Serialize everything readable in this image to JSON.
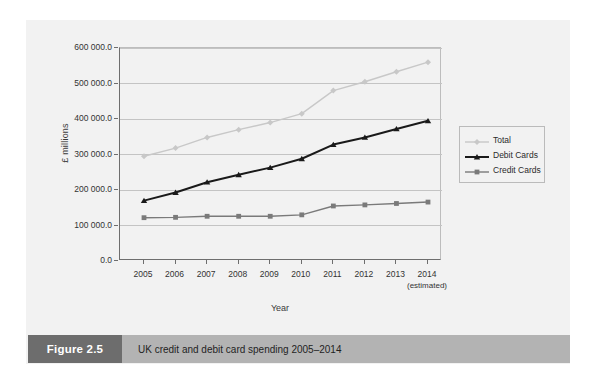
{
  "figure": {
    "caption_tag": "Figure 2.5",
    "caption_text": "UK credit and debit card spending 2005–2014"
  },
  "axes": {
    "ylabel": "£ millions",
    "xlabel": "Year",
    "estimated_note": "(estimated)"
  },
  "colors": {
    "total": "#c8c8c8",
    "debit": "#1a1a1a",
    "credit": "#7a7a7a",
    "grid": "#c4c4c4",
    "axis": "#6e6e6e",
    "page": "#f2f2f2",
    "caption_tag_bg": "#6d6d6d",
    "caption_text_bg": "#b3b3b3"
  },
  "chart_data": {
    "type": "line",
    "title": "UK credit and debit card spending 2005–2014",
    "xlabel": "Year",
    "ylabel": "£ millions",
    "grid": true,
    "legend_position": "right",
    "ylim": [
      0,
      600000
    ],
    "yticks": [
      0,
      100000,
      200000,
      300000,
      400000,
      500000,
      600000
    ],
    "ytick_labels": [
      "0.0",
      "100 000.0",
      "200 000.0",
      "300 000.0",
      "400 000.0",
      "500 000.0",
      "600 000.0"
    ],
    "categories": [
      "2005",
      "2006",
      "2007",
      "2008",
      "2009",
      "2010",
      "2011",
      "2012",
      "2013",
      "2014"
    ],
    "annotations": [
      "2014 (estimated)"
    ],
    "series": [
      {
        "name": "Total",
        "marker": "diamond",
        "color": "#c8c8c8",
        "values": [
          295000,
          318000,
          348000,
          370000,
          390000,
          415000,
          480000,
          505000,
          533000,
          560000
        ]
      },
      {
        "name": "Debit Cards",
        "marker": "triangle",
        "color": "#1a1a1a",
        "values": [
          170000,
          193000,
          222000,
          243000,
          263000,
          288000,
          328000,
          348000,
          372000,
          395000
        ]
      },
      {
        "name": "Credit Cards",
        "marker": "square",
        "color": "#7a7a7a",
        "values": [
          122000,
          123000,
          126000,
          126000,
          126000,
          130000,
          155000,
          158000,
          162000,
          166000
        ]
      }
    ]
  }
}
